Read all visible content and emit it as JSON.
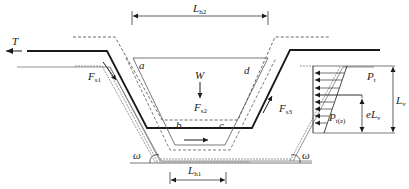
{
  "diagram": {
    "type": "mechanical free-body diagram of trapezoidal trench / pipe section with lateral earth pressure",
    "labels": {
      "T": {
        "main": "T",
        "sub": ""
      },
      "Fs1": {
        "main": "F",
        "sub": "s1"
      },
      "Fs2": {
        "main": "F",
        "sub": "s2"
      },
      "Fs3": {
        "main": "F",
        "sub": "s3"
      },
      "W": {
        "main": "W",
        "sub": ""
      },
      "a": {
        "main": "a",
        "sub": ""
      },
      "b": {
        "main": "b",
        "sub": ""
      },
      "c": {
        "main": "c",
        "sub": ""
      },
      "d": {
        "main": "d",
        "sub": ""
      },
      "Lh2": {
        "main": "L",
        "sub": "h2"
      },
      "Lh1": {
        "main": "L",
        "sub": "h1"
      },
      "Lv": {
        "main": "L",
        "sub": "v"
      },
      "eLv": {
        "main": "eL",
        "sub": "v"
      },
      "Pt": {
        "main": "P",
        "sub": "t"
      },
      "Ptz": {
        "main": "P",
        "sub": "t(z)"
      },
      "omega_left": {
        "main": "ω",
        "sub": ""
      },
      "omega_right": {
        "main": "ω",
        "sub": ""
      }
    },
    "colors": {
      "line": "#1a1a1a",
      "gray": "#777777",
      "dashed": "#444444"
    }
  }
}
